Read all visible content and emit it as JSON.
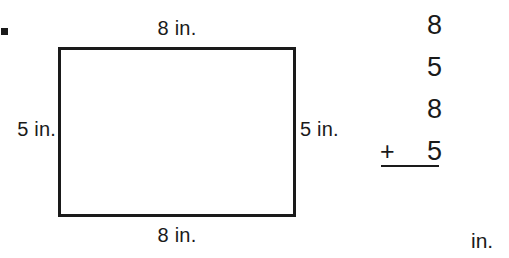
{
  "page": {
    "background_color": "#ffffff",
    "ink_color": "#1a1a1a",
    "bullet_marker": "square-bullet"
  },
  "figure": {
    "shape": "rectangle",
    "border_color": "#1a1a1a",
    "labels": {
      "top": "8 in.",
      "bottom": "8 in.",
      "left": "5 in.",
      "right": "5 in."
    }
  },
  "addition_problem": {
    "addends": [
      "8",
      "5",
      "8",
      "5"
    ],
    "operator": "+",
    "rule": "horizontal-rule",
    "answer_unit": "in."
  }
}
